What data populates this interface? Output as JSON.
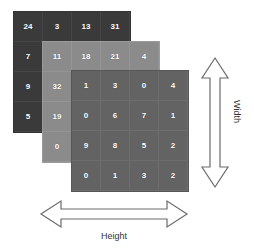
{
  "diagram": {
    "colors": {
      "background": "#ffffff",
      "matrix_back": "#3a3a3a",
      "matrix_middle": "#8b8b8b",
      "matrix_front": "#636363",
      "cell_text": "#ffffff",
      "arrow_stroke": "#666666",
      "label_text": "#333333"
    }
  },
  "matrices": [
    {
      "name": "back-matrix",
      "rows": [
        [
          "24",
          "3",
          "13",
          "31"
        ],
        [
          "7",
          "11",
          "18",
          "21"
        ],
        [
          "9",
          "32",
          "1",
          "3"
        ],
        [
          "5",
          "19",
          "0",
          "6"
        ]
      ]
    },
    {
      "name": "middle-matrix",
      "rows": [
        [
          "11",
          "18",
          "21",
          "4"
        ],
        [
          "32",
          "1",
          "3",
          "0"
        ],
        [
          "19",
          "0",
          "6",
          "7"
        ],
        [
          "0",
          "9",
          "8",
          "5"
        ]
      ]
    },
    {
      "name": "front-matrix",
      "rows": [
        [
          "1",
          "3",
          "0",
          "4"
        ],
        [
          "0",
          "6",
          "7",
          "1"
        ],
        [
          "9",
          "8",
          "5",
          "2"
        ],
        [
          "0",
          "1",
          "3",
          "2"
        ]
      ]
    }
  ],
  "labels": {
    "width": "Width",
    "height": "Height"
  }
}
